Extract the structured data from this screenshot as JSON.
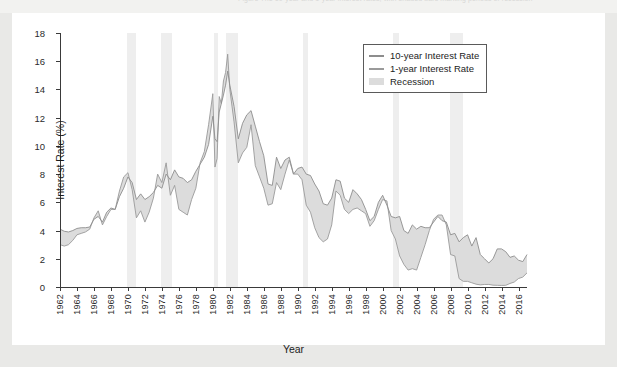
{
  "caption": {
    "text": "Figure   The 10-year and 1-year interest rates, with shaded bars marking periods of recession"
  },
  "colors": {
    "line_10y": "#8d8d8d",
    "line_1y": "#9a9a9a",
    "band_fill": "#dcdcdc",
    "recession": "#eeeeee",
    "axis": "#3a3a3a",
    "panel": "#ffffff",
    "page": "#e9e9e7"
  },
  "legend": {
    "position": "top-right-inside",
    "entries": [
      {
        "label": "10-year Interest Rate",
        "key": "line"
      },
      {
        "label": "1-year Interest Rate",
        "key": "line"
      },
      {
        "label": "Recession",
        "key": "swatch"
      }
    ]
  },
  "chart_data": {
    "type": "line",
    "title": "",
    "subtitle": "",
    "xlabel": "Year",
    "ylabel": "Interest Rate (%)",
    "xlim": [
      1962,
      2017
    ],
    "ylim": [
      0,
      18
    ],
    "grid": false,
    "yticks": [
      0,
      2,
      4,
      6,
      8,
      10,
      12,
      14,
      16,
      18
    ],
    "ytick_labels": [
      "0",
      "2",
      "4",
      "6",
      "8",
      "10",
      "12",
      "14",
      "16",
      "18"
    ],
    "xticks": [
      1962,
      1964,
      1966,
      1968,
      1970,
      1972,
      1974,
      1976,
      1978,
      1980,
      1982,
      1984,
      1986,
      1988,
      1990,
      1992,
      1994,
      1996,
      1998,
      2000,
      2002,
      2004,
      2006,
      2008,
      2010,
      2012,
      2014,
      2016
    ],
    "xtick_labels": [
      "1962",
      "1964",
      "1966",
      "1968",
      "1970",
      "1972",
      "1974",
      "1976",
      "1978",
      "1980",
      "1982",
      "1984",
      "1986",
      "1988",
      "1990",
      "1992",
      "1994",
      "1996",
      "1998",
      "2000",
      "2002",
      "2004",
      "2006",
      "2008",
      "2010",
      "2012",
      "2014",
      "2016"
    ],
    "shaded_between_series": true,
    "recessions": [
      {
        "start": 1969.92,
        "end": 1970.92
      },
      {
        "start": 1973.92,
        "end": 1975.17
      },
      {
        "start": 1980.08,
        "end": 1980.58
      },
      {
        "start": 1981.58,
        "end": 1982.92
      },
      {
        "start": 1990.58,
        "end": 1991.25
      },
      {
        "start": 2001.17,
        "end": 2001.92
      },
      {
        "start": 2007.92,
        "end": 2009.5
      }
    ],
    "x": [
      1962.0,
      1962.5,
      1963.0,
      1963.5,
      1964.0,
      1964.5,
      1965.0,
      1965.5,
      1966.0,
      1966.5,
      1967.0,
      1967.5,
      1968.0,
      1968.5,
      1969.0,
      1969.5,
      1970.0,
      1970.5,
      1971.0,
      1971.5,
      1972.0,
      1972.5,
      1973.0,
      1973.5,
      1974.0,
      1974.5,
      1975.0,
      1975.5,
      1976.0,
      1976.5,
      1977.0,
      1977.5,
      1978.0,
      1978.5,
      1979.0,
      1979.5,
      1980.0,
      1980.25,
      1980.5,
      1980.75,
      1981.0,
      1981.25,
      1981.5,
      1981.75,
      1982.0,
      1982.5,
      1983.0,
      1983.5,
      1984.0,
      1984.5,
      1985.0,
      1985.5,
      1986.0,
      1986.5,
      1987.0,
      1987.5,
      1988.0,
      1988.5,
      1989.0,
      1989.5,
      1990.0,
      1990.5,
      1991.0,
      1991.5,
      1992.0,
      1992.5,
      1993.0,
      1993.5,
      1994.0,
      1994.5,
      1995.0,
      1995.5,
      1996.0,
      1996.5,
      1997.0,
      1997.5,
      1998.0,
      1998.5,
      1999.0,
      1999.5,
      2000.0,
      2000.5,
      2001.0,
      2001.5,
      2002.0,
      2002.5,
      2003.0,
      2003.5,
      2004.0,
      2004.5,
      2005.0,
      2005.5,
      2006.0,
      2006.5,
      2007.0,
      2007.5,
      2008.0,
      2008.5,
      2009.0,
      2009.5,
      2010.0,
      2010.5,
      2011.0,
      2011.5,
      2012.0,
      2012.5,
      2013.0,
      2013.5,
      2014.0,
      2014.5,
      2015.0,
      2015.5,
      2016.0,
      2016.5,
      2017.0
    ],
    "series": [
      {
        "name": "10-year Interest Rate",
        "values": [
          4.1,
          3.95,
          3.9,
          4.0,
          4.15,
          4.2,
          4.2,
          4.25,
          4.8,
          5.0,
          4.6,
          5.3,
          5.6,
          5.5,
          6.4,
          7.0,
          7.8,
          7.4,
          6.2,
          6.6,
          6.2,
          6.4,
          6.7,
          7.2,
          7.0,
          8.0,
          7.6,
          8.3,
          7.8,
          7.7,
          7.4,
          7.6,
          8.2,
          8.7,
          9.2,
          10.1,
          12.1,
          10.5,
          10.3,
          12.4,
          13.0,
          13.6,
          14.3,
          15.3,
          14.3,
          12.8,
          10.5,
          11.6,
          12.2,
          12.5,
          11.4,
          10.3,
          9.3,
          7.3,
          7.2,
          9.2,
          8.4,
          9.0,
          9.2,
          8.0,
          8.4,
          8.5,
          8.0,
          7.9,
          7.3,
          6.8,
          5.9,
          5.8,
          6.3,
          7.6,
          7.5,
          6.3,
          6.0,
          6.9,
          6.6,
          6.2,
          5.5,
          4.7,
          5.0,
          6.0,
          6.5,
          5.8,
          5.0,
          4.9,
          5.0,
          4.0,
          3.8,
          4.4,
          4.1,
          4.3,
          4.2,
          4.2,
          4.6,
          5.0,
          4.7,
          4.6,
          3.7,
          3.8,
          3.2,
          3.5,
          3.7,
          2.9,
          3.5,
          2.3,
          2.0,
          1.7,
          2.0,
          2.7,
          2.7,
          2.5,
          2.1,
          2.2,
          1.9,
          1.8,
          2.3
        ]
      },
      {
        "name": "1-year Interest Rate",
        "values": [
          3.0,
          2.9,
          3.0,
          3.3,
          3.7,
          3.8,
          3.9,
          4.1,
          4.9,
          5.4,
          4.4,
          5.0,
          5.5,
          5.5,
          6.8,
          7.8,
          8.1,
          6.9,
          4.9,
          5.4,
          4.6,
          5.3,
          6.3,
          8.0,
          7.4,
          8.8,
          6.5,
          7.2,
          5.5,
          5.3,
          5.1,
          6.2,
          7.0,
          8.8,
          9.6,
          11.5,
          13.7,
          8.5,
          9.1,
          13.5,
          13.0,
          14.6,
          15.2,
          16.5,
          14.0,
          11.7,
          8.8,
          9.5,
          9.9,
          11.5,
          8.6,
          7.8,
          7.0,
          5.8,
          5.9,
          7.4,
          6.9,
          8.0,
          9.0,
          8.0,
          8.0,
          7.6,
          5.8,
          5.3,
          4.2,
          3.5,
          3.2,
          3.4,
          4.4,
          6.8,
          6.5,
          5.5,
          5.2,
          5.5,
          5.6,
          5.4,
          5.2,
          4.3,
          4.7,
          5.5,
          6.2,
          6.1,
          4.0,
          3.4,
          2.2,
          1.6,
          1.2,
          1.3,
          1.2,
          2.1,
          3.0,
          4.0,
          4.8,
          5.1,
          5.1,
          4.4,
          2.3,
          2.2,
          0.6,
          0.4,
          0.4,
          0.3,
          0.2,
          0.15,
          0.18,
          0.18,
          0.13,
          0.12,
          0.11,
          0.12,
          0.25,
          0.35,
          0.6,
          0.7,
          1.0
        ]
      }
    ]
  }
}
